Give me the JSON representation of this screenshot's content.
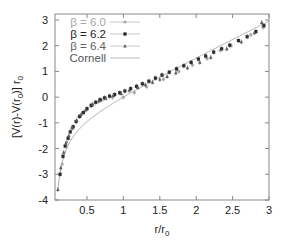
{
  "chart_data": {
    "type": "scatter",
    "title": "",
    "xlabel": "r/r0",
    "ylabel": "[V(r)-V(r0)] r0",
    "xlim": [
      0.06,
      3.0
    ],
    "ylim": [
      -4,
      3
    ],
    "xticks": [
      0.5,
      1,
      1.5,
      2,
      2.5,
      3
    ],
    "xtick_labels": [
      "0.5",
      "1",
      "1.5",
      "2",
      "2.5",
      "3"
    ],
    "yticks": [
      -4,
      -3,
      -2,
      -1,
      0,
      1,
      2,
      3
    ],
    "ytick_labels": [
      "-4",
      "-3",
      "-2",
      "-1",
      "0",
      "1",
      "2",
      "3"
    ],
    "grid": false,
    "legend_position": "upper left",
    "series": [
      {
        "name": "β = 6.0",
        "marker": "circle",
        "color": "#a8a8a8",
        "x": [
          0.16,
          0.22,
          0.29,
          0.39,
          0.55,
          0.7,
          0.85,
          1.0,
          1.15,
          1.32,
          1.55,
          1.76,
          1.95,
          2.15,
          2.33,
          2.48,
          2.75,
          2.92
        ],
        "y": [
          -2.6,
          -1.75,
          -1.2,
          -0.75,
          -0.33,
          -0.12,
          -0.01,
          0.0,
          0.18,
          0.4,
          0.7,
          1.0,
          1.25,
          1.5,
          1.82,
          2.0,
          2.42,
          2.72
        ]
      },
      {
        "name": "β = 6.2",
        "marker": "square",
        "color": "#2e2e2e",
        "x": [
          0.13,
          0.17,
          0.2,
          0.24,
          0.27,
          0.31,
          0.35,
          0.4,
          0.45,
          0.5,
          0.56,
          0.62,
          0.68,
          0.74,
          0.81,
          0.88,
          0.95,
          1.02,
          1.1,
          1.18,
          1.26,
          1.35,
          1.44,
          1.53,
          1.63,
          1.73,
          1.83,
          1.93,
          2.03,
          2.13,
          2.24,
          2.35,
          2.46,
          2.58,
          2.7,
          2.82,
          2.93
        ],
        "y": [
          -3.0,
          -2.3,
          -1.9,
          -1.6,
          -1.35,
          -1.15,
          -0.95,
          -0.75,
          -0.6,
          -0.45,
          -0.32,
          -0.2,
          -0.1,
          -0.03,
          0.04,
          0.1,
          0.17,
          0.24,
          0.33,
          0.42,
          0.52,
          0.62,
          0.74,
          0.86,
          0.97,
          1.1,
          1.22,
          1.35,
          1.48,
          1.6,
          1.75,
          1.88,
          2.02,
          2.2,
          2.35,
          2.55,
          2.78
        ]
      },
      {
        "name": "β = 6.4",
        "marker": "triangle",
        "color": "#5e5e5e",
        "x": [
          0.1,
          0.14,
          0.18,
          0.21,
          0.25,
          0.3,
          0.36,
          0.42,
          0.48,
          0.58,
          0.66,
          0.76,
          0.86,
          0.97,
          1.08,
          1.2,
          1.3,
          1.4,
          1.5,
          1.6,
          1.72,
          1.88,
          2.05,
          2.2,
          2.42,
          2.62,
          2.8,
          2.9
        ],
        "y": [
          -3.6,
          -2.75,
          -2.15,
          -1.8,
          -1.5,
          -1.2,
          -0.9,
          -0.67,
          -0.5,
          -0.28,
          -0.15,
          -0.04,
          0.06,
          0.14,
          0.26,
          0.37,
          0.48,
          0.58,
          0.69,
          0.8,
          0.94,
          1.14,
          1.35,
          1.55,
          1.88,
          2.15,
          2.5,
          2.9
        ]
      },
      {
        "name": "Cornell",
        "marker": "line",
        "color": "#999999",
        "formula": "-e*(1/x-1)+(1.65-e)*(x-1), e=0.26",
        "x": [
          0.1,
          0.15,
          0.2,
          0.3,
          0.4,
          0.5,
          0.7,
          1.0,
          1.5,
          2.0,
          2.5,
          3.0
        ],
        "y": [
          -3.6,
          -2.65,
          -2.15,
          -1.58,
          -1.22,
          -0.96,
          -0.53,
          0.0,
          0.78,
          1.52,
          2.24,
          2.95
        ]
      }
    ]
  },
  "legend": {
    "items": [
      {
        "label": "β = 6.0",
        "color": "#a8a8a8"
      },
      {
        "label": "β = 6.2",
        "color": "#222222"
      },
      {
        "label": "β = 6.4",
        "color": "#5e5e5e"
      },
      {
        "label": "Cornell",
        "color": "#555555"
      }
    ]
  },
  "axes": {
    "xlabel_main": "r/r",
    "xlabel_sub": "0",
    "ylabel_pre": "[V(r)-V(r",
    "ylabel_sub": "0",
    "ylabel_post": ")] r",
    "ylabel_sub2": "0"
  }
}
